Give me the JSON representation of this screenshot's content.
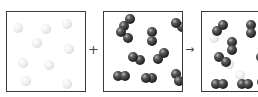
{
  "diagram": {
    "type": "particle-reaction",
    "panels": [
      {
        "id": "reactant-1",
        "description": "white single atoms",
        "particle_kind": "atom",
        "color": "#e8e8e8",
        "count": 9,
        "particles": [
          [
            11,
            16
          ],
          [
            39,
            17
          ],
          [
            60,
            12
          ],
          [
            30,
            31
          ],
          [
            62,
            37
          ],
          [
            16,
            51
          ],
          [
            42,
            53
          ],
          [
            19,
            69
          ],
          [
            60,
            72
          ]
        ]
      },
      {
        "id": "reactant-2",
        "description": "dark diatomic molecules",
        "particle_kind": "diatomic",
        "color": "#3c3c3c",
        "count": 9,
        "molecules": [
          [
            [
              26,
              7
            ],
            [
              20,
              14
            ]
          ],
          [
            [
              78,
              15
            ],
            [
              72,
              11
            ]
          ],
          [
            [
              24,
              26
            ],
            [
              17,
              20
            ]
          ],
          [
            [
              48,
              20
            ],
            [
              48,
              29
            ]
          ],
          [
            [
              36,
              48
            ],
            [
              29,
              45
            ]
          ],
          [
            [
              60,
              41
            ],
            [
              54,
              47
            ]
          ],
          [
            [
              14,
              64
            ],
            [
              21,
              64
            ]
          ],
          [
            [
              48,
              66
            ],
            [
              42,
              66
            ]
          ],
          [
            [
              72,
              62
            ],
            [
              75,
              69
            ]
          ]
        ]
      },
      {
        "id": "product",
        "description": "mixture of dark diatomic molecules and faint white atoms",
        "particle_kind": "mixture",
        "color": "#3c3c3c",
        "molecules": [
          [
            [
              21,
              13
            ],
            [
              15,
              19
            ]
          ],
          [
            [
              49,
              13
            ],
            [
              49,
              21
            ]
          ],
          [
            [
              30,
              30
            ],
            [
              30,
              38
            ]
          ],
          [
            [
              17,
              45
            ],
            [
              24,
              50
            ]
          ],
          [
            [
              14,
              72
            ],
            [
              21,
              72
            ]
          ],
          [
            [
              40,
              72
            ],
            [
              46,
              72
            ]
          ],
          [
            [
              59,
              45
            ],
            [
              63,
              51
            ]
          ],
          [
            [
              60,
              70
            ],
            [
              65,
              70
            ]
          ]
        ],
        "faint_atoms": [
          [
            12,
            26
          ],
          [
            27,
            52
          ],
          [
            38,
            63
          ]
        ]
      }
    ],
    "operators": {
      "plus": "+",
      "arrow": "→"
    }
  }
}
